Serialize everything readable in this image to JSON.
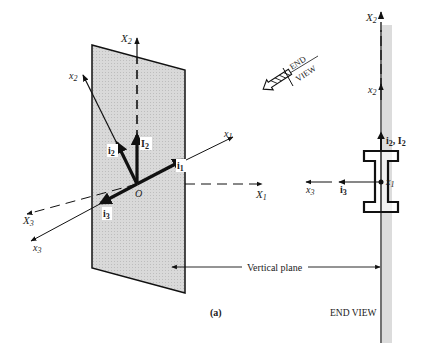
{
  "figure": {
    "caption": "(a)",
    "colors": {
      "ink": "#111111",
      "plane_fill": "#d4d4d4",
      "end_view_strip": "#dcdcdc",
      "background": "#ffffff"
    },
    "main_view": {
      "origin_label": "O",
      "global_axes": [
        {
          "id": "X1",
          "base": "X",
          "sub": "1",
          "style": "dashed"
        },
        {
          "id": "X2",
          "base": "X",
          "sub": "2",
          "style": "dashed"
        },
        {
          "id": "X3",
          "base": "X",
          "sub": "3",
          "style": "dashed"
        }
      ],
      "local_axes": [
        {
          "id": "x1",
          "base": "x",
          "sub": "1",
          "style": "solid"
        },
        {
          "id": "x2",
          "base": "x",
          "sub": "2",
          "style": "solid"
        },
        {
          "id": "x3",
          "base": "x",
          "sub": "3",
          "style": "solid"
        }
      ],
      "unit_vectors": [
        {
          "id": "i1",
          "base": "i",
          "sub": "1"
        },
        {
          "id": "i2",
          "base": "i",
          "sub": "2"
        },
        {
          "id": "i3",
          "base": "i",
          "sub": "3"
        },
        {
          "id": "I2",
          "base": "I",
          "sub": "2"
        }
      ],
      "vertical_plane_label": "Vertical plane"
    },
    "view_direction": {
      "line1": "END",
      "line2": "VIEW"
    },
    "end_view": {
      "title": "END VIEW",
      "axis_X2": {
        "base": "X",
        "sub": "2"
      },
      "axis_x2": {
        "base": "x",
        "sub": "2"
      },
      "axis_x1": {
        "base": "x",
        "sub": "1"
      },
      "axis_x3": {
        "base": "x",
        "sub": "3"
      },
      "vec_i3": {
        "base": "i",
        "sub": "3"
      },
      "vec_i2_I2": {
        "base1": "i",
        "sub1": "2",
        "sep": ", ",
        "base2": "I",
        "sub2": "2"
      }
    }
  }
}
